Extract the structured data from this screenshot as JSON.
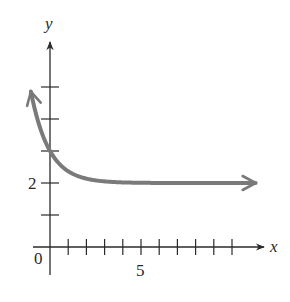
{
  "chart_data": {
    "type": "line",
    "title": "",
    "xlabel": "x",
    "ylabel": "y",
    "function": "y = 2 + e^(-x)",
    "asymptote": 2,
    "y_intercept": 3,
    "xlim": [
      -1.0,
      11.5
    ],
    "ylim": [
      -0.9,
      6.3
    ],
    "x_ticks": [
      1,
      2,
      3,
      4,
      5,
      6,
      7,
      8,
      9,
      10
    ],
    "y_ticks": [
      1,
      2,
      3,
      4,
      5
    ],
    "tick_labels": {
      "origin": "0",
      "x": [
        {
          "value": 5,
          "label": "5"
        }
      ],
      "y": [
        {
          "value": 2,
          "label": "2"
        }
      ]
    },
    "series": [
      {
        "name": "curve",
        "color": "#7a7a7a",
        "x": [
          -1.05,
          -0.75,
          -0.5,
          -0.25,
          0,
          0.25,
          0.5,
          0.75,
          1,
          1.5,
          2,
          2.5,
          3,
          4,
          5,
          6,
          7,
          8,
          9,
          11.3
        ],
        "y": [
          4.86,
          4.12,
          3.65,
          3.28,
          3.0,
          2.78,
          2.61,
          2.47,
          2.37,
          2.22,
          2.14,
          2.08,
          2.05,
          2.02,
          2.01,
          2.0,
          2.0,
          2.0,
          2.0,
          2.0
        ]
      }
    ],
    "grid": false,
    "legend": null
  },
  "labels": {
    "x_axis": "x",
    "y_axis": "y",
    "origin": "0",
    "x_tick_5": "5",
    "y_tick_2": "2"
  },
  "colors": {
    "axis": "#2a2a2a",
    "curve": "#7a7a7a"
  }
}
